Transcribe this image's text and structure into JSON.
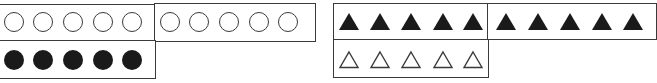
{
  "left_panel": {
    "name": "circles-ten-frame",
    "top_row": {
      "left_group": {
        "shape": "open-circle",
        "count": 5
      },
      "right_group": {
        "shape": "open-circle",
        "count": 5
      }
    },
    "bottom_row": {
      "left_group": {
        "shape": "filled-circle",
        "count": 5
      }
    }
  },
  "right_panel": {
    "name": "triangles-ten-frame",
    "top_row": {
      "left_group": {
        "shape": "filled-triangle",
        "count": 5
      },
      "right_group": {
        "shape": "filled-triangle",
        "count": 5
      }
    },
    "bottom_row": {
      "left_group": {
        "shape": "open-triangle",
        "count": 5
      }
    }
  },
  "colors": {
    "stroke": "#3a3a3a",
    "fill": "#1a1a1a",
    "background": "#ffffff"
  }
}
